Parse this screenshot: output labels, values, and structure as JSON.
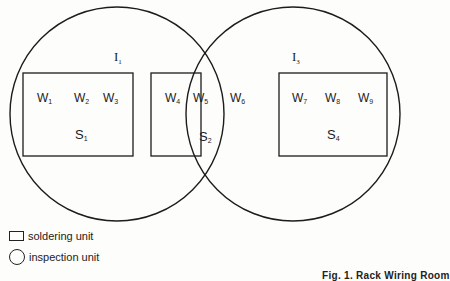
{
  "figure": {
    "caption": "Fig. 1. Rack Wiring Room",
    "inspection_units": [
      {
        "id": "I1",
        "label": "I",
        "sub": "1"
      },
      {
        "id": "I3",
        "label": "I",
        "sub": "3"
      }
    ],
    "soldering_units": [
      {
        "id": "S1",
        "label": "S",
        "sub": "1",
        "workers": [
          {
            "label": "W",
            "sub": "1"
          },
          {
            "label": "W",
            "sub": "2"
          },
          {
            "label": "W",
            "sub": "3"
          }
        ]
      },
      {
        "id": "S2",
        "label": "S",
        "sub": "2",
        "workers": [
          {
            "label": "W",
            "sub": "4"
          },
          {
            "label": "W",
            "sub": "5"
          },
          {
            "label": "W",
            "sub": "6"
          }
        ]
      },
      {
        "id": "S4",
        "label": "S",
        "sub": "4",
        "workers": [
          {
            "label": "W",
            "sub": "7"
          },
          {
            "label": "W",
            "sub": "8"
          },
          {
            "label": "W",
            "sub": "9"
          }
        ]
      }
    ]
  },
  "legend": {
    "soldering": "soldering unit",
    "inspection": "inspection unit"
  }
}
